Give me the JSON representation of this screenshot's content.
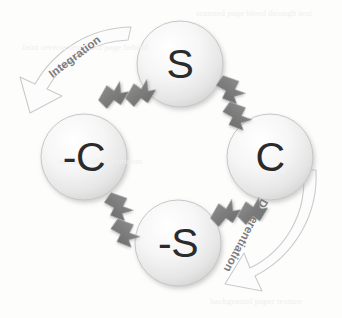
{
  "diagram": {
    "type": "cyclic-diagram",
    "background_color": "#fdfdfc",
    "nodes": [
      {
        "id": "node-s",
        "label": "S",
        "position": "top",
        "cx": 180,
        "cy": 64,
        "r": 43
      },
      {
        "id": "node-c",
        "label": "C",
        "position": "right",
        "cx": 270,
        "cy": 157,
        "r": 43
      },
      {
        "id": "node-neg-s",
        "label": "-S",
        "position": "bottom",
        "cx": 178,
        "cy": 243,
        "r": 43
      },
      {
        "id": "node-neg-c",
        "label": "-C",
        "position": "left",
        "cx": 84,
        "cy": 157,
        "r": 43
      }
    ],
    "node_style": {
      "fill_light": "#fefefe",
      "fill_dark": "#d9d9d9",
      "stroke": "#c9c9c9",
      "text_color": "#2b2b2b"
    },
    "arcs": [
      {
        "id": "arc-integration",
        "label": "Integration",
        "direction": "counter-clockwise",
        "from": "node-s",
        "to": "node-neg-c",
        "side": "upper-left",
        "rotation_deg": -37,
        "label_x": 50,
        "label_y": 75,
        "stroke": "#cfcfcf",
        "fill": "#fcfcfc"
      },
      {
        "id": "arc-differentiation",
        "label": "Differentiation",
        "direction": "clockwise",
        "from": "node-c",
        "to": "node-neg-s",
        "side": "lower-right",
        "rotation_deg": 118,
        "label_x": 265,
        "label_y": 200,
        "stroke": "#cfcfcf",
        "fill": "#fcfcfc"
      }
    ],
    "connectors": [
      {
        "id": "connector-negc-s",
        "between": [
          "node-neg-c",
          "node-s"
        ],
        "position": "top-left",
        "cx": 120,
        "cy": 95,
        "rotation_deg": -40,
        "color": "#7d7d7d"
      },
      {
        "id": "connector-s-c",
        "between": [
          "node-s",
          "node-c"
        ],
        "position": "top-right",
        "cx": 232,
        "cy": 96,
        "rotation_deg": 40,
        "color": "#7d7d7d"
      },
      {
        "id": "connector-negs-negc",
        "between": [
          "node-neg-s",
          "node-neg-c"
        ],
        "position": "bottom-left",
        "cx": 120,
        "cy": 213,
        "rotation_deg": 40,
        "color": "#7d7d7d"
      },
      {
        "id": "connector-c-negs",
        "between": [
          "node-c",
          "node-neg-s"
        ],
        "position": "bottom-right",
        "cx": 232,
        "cy": 213,
        "rotation_deg": -40,
        "color": "#7d7d7d"
      }
    ],
    "connector_color": "#7d7d7d",
    "arc_stroke_color": "#cfcfcf",
    "arc_label_color": "#7b7b7b",
    "ghost_artifacts": [
      {
        "text": "scanned page bleed through text",
        "x": 196,
        "y": 14,
        "rotation_deg": 0
      },
      {
        "text": "faint reverse text from page behind",
        "x": 22,
        "y": 46,
        "rotation_deg": 0
      },
      {
        "text": "residual ink impression",
        "x": 58,
        "y": 160,
        "rotation_deg": 0
      },
      {
        "text": "background paper texture",
        "x": 210,
        "y": 300,
        "rotation_deg": 0
      }
    ]
  }
}
